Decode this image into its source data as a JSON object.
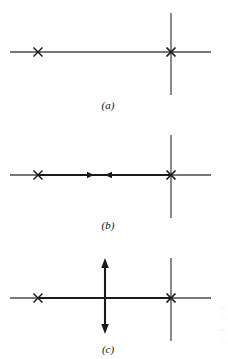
{
  "figure": {
    "caption_labels": {
      "a": "(a)",
      "b": "(b)",
      "c": "(c)"
    },
    "colors": {
      "ink": "#1a1a1a",
      "thin_line": "#4a4a4a",
      "background": "#ffffff"
    },
    "geometry": {
      "width": 228,
      "height": 359,
      "axis_x_start": 10,
      "axis_x_end": 211,
      "mark_left_x": 38,
      "mark_right_x": 171,
      "mark_size": 9,
      "vertical_line_x": 171,
      "vertical_half_height": 41,
      "arrow_column_x": 105
    },
    "panels": [
      {
        "id": "a",
        "label": "(a)",
        "baseline_y": 52,
        "label_y": 99,
        "elements": [
          "horizontal-axis-line",
          "cross-mark-left",
          "cross-mark-right",
          "vertical-line-right"
        ]
      },
      {
        "id": "b",
        "label": "(b)",
        "baseline_y": 175,
        "label_y": 219,
        "elements": [
          "horizontal-axis-line",
          "cross-mark-left",
          "cross-mark-right",
          "vertical-line-right",
          "thick-branch-segment",
          "arrowhead-right-pointing",
          "arrowhead-left-pointing"
        ],
        "branch": {
          "from_x": 38,
          "to_x": 171,
          "arrowhead_right_x": 93,
          "arrowhead_left_x": 106
        }
      },
      {
        "id": "c",
        "label": "(c)",
        "baseline_y": 298,
        "label_y": 343,
        "elements": [
          "horizontal-axis-line",
          "cross-mark-left",
          "cross-mark-right",
          "vertical-line-right",
          "thick-branch-segment",
          "vertical-double-arrow"
        ],
        "branch": {
          "from_x": 38,
          "to_x": 171
        },
        "double_arrow": {
          "x": 105,
          "top_y": 259,
          "bottom_y": 334
        }
      }
    ]
  }
}
